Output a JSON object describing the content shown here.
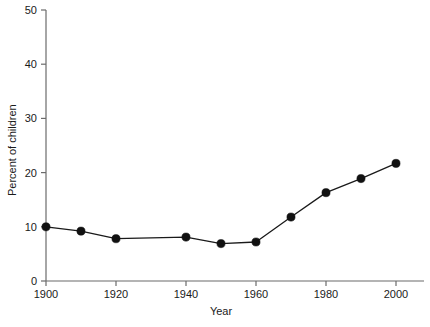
{
  "chart_data": {
    "type": "line",
    "title": "",
    "subtitle": "",
    "xlabel": "Year",
    "ylabel": "Percent of children",
    "xlim": [
      1900,
      2000
    ],
    "ylim": [
      0,
      50
    ],
    "grid": false,
    "legend": null,
    "x_ticks": [
      "1900",
      "1920",
      "1940",
      "1960",
      "1980",
      "2000"
    ],
    "x_tick_values": [
      1900,
      1920,
      1940,
      1960,
      1980,
      2000
    ],
    "y_ticks": [
      "0",
      "10",
      "20",
      "30",
      "40",
      "50"
    ],
    "y_tick_values": [
      0,
      10,
      20,
      30,
      40,
      50
    ],
    "series": [
      {
        "name": "Percent of children",
        "marker": "filled-circle",
        "color": "#111111",
        "x": [
          1900,
          1910,
          1920,
          1940,
          1950,
          1960,
          1970,
          1980,
          1990,
          2000
        ],
        "values": [
          10.0,
          9.2,
          7.8,
          8.1,
          6.9,
          7.2,
          11.8,
          16.3,
          18.9,
          21.7
        ]
      }
    ],
    "annotations": []
  },
  "axes": {
    "y_axis_label": "Percent of children",
    "x_axis_label": "Year"
  }
}
